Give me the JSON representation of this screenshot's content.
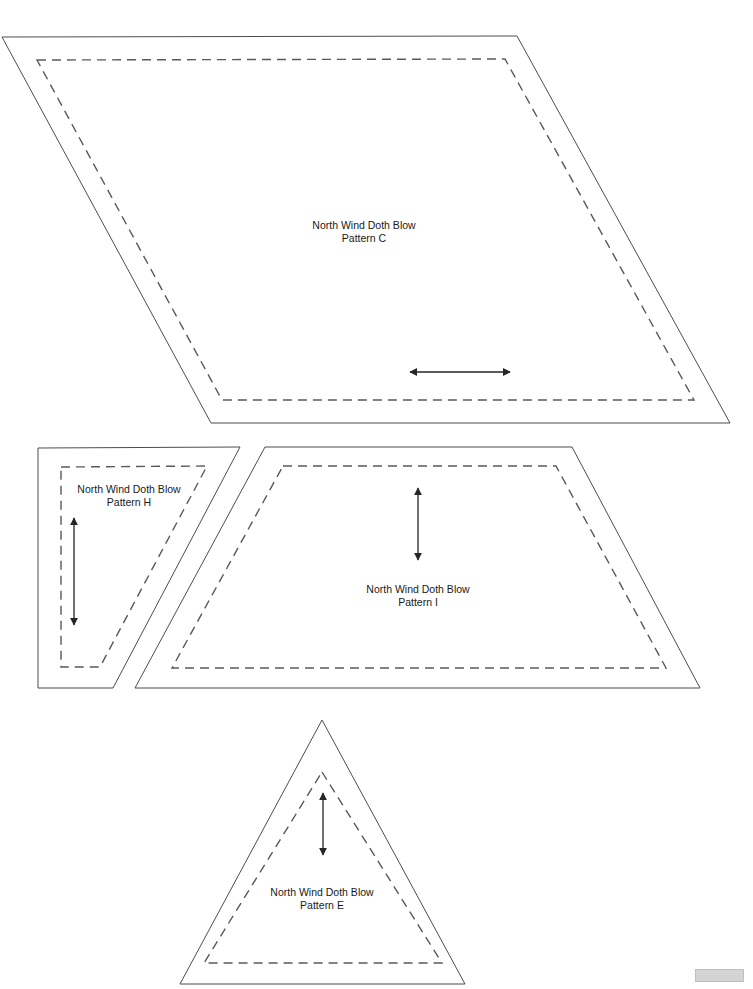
{
  "document": {
    "title": "North Wind Doth Blow",
    "kind": "quilt-pattern-template-sheet",
    "page_background": "#ffffff",
    "line_color": "#4d4d4d",
    "dash_color": "#595959",
    "arrow_color": "#262626"
  },
  "patterns": [
    {
      "id": "C",
      "name": "pattern-c",
      "label_line1": "North Wind Doth Blow",
      "label_line2": "Pattern C",
      "shape": "parallelogram",
      "cut_points": "2,37 517,36 730,423 211,423",
      "sew_points": "37,60 505,59 694,400 222,400",
      "label_x": 279,
      "label_y": 219,
      "label_width": 170,
      "grain_arrow": {
        "orientation": "horizontal",
        "x1": 410,
        "y1": 372,
        "x2": 510,
        "y2": 372
      }
    },
    {
      "id": "H",
      "name": "pattern-h",
      "label_line1": "North Wind Doth Blow",
      "label_line2": "Pattern H",
      "shape": "trapezoid",
      "cut_points": "38,448 240,447 113,688 38,688",
      "sew_points": "61,467 207,466 100,667 61,667",
      "label_x": 44,
      "label_y": 483,
      "label_width": 170,
      "grain_arrow": {
        "orientation": "vertical",
        "x1": 74,
        "y1": 518,
        "x2": 74,
        "y2": 625
      }
    },
    {
      "id": "I",
      "name": "pattern-i",
      "label_line1": "North Wind Doth Blow",
      "label_line2": "Pattern I",
      "shape": "trapezoid",
      "cut_points": "265,447 572,447 700,688 135,688",
      "sew_points": "283,466 556,466 666,668 172,668",
      "label_x": 333,
      "label_y": 583,
      "label_width": 170,
      "grain_arrow": {
        "orientation": "vertical",
        "x1": 418,
        "y1": 488,
        "x2": 418,
        "y2": 560
      }
    },
    {
      "id": "E",
      "name": "pattern-e",
      "label_line1": "North Wind Doth Blow",
      "label_line2": "Pattern E",
      "shape": "triangle",
      "cut_points": "322,720 465,984 180,984",
      "sew_points": "322,772 442,963 204,963",
      "label_x": 237,
      "label_y": 886,
      "label_width": 170,
      "grain_arrow": {
        "orientation": "vertical",
        "x1": 323,
        "y1": 793,
        "x2": 323,
        "y2": 855
      }
    }
  ],
  "page_marker": {
    "name": "page-corner-marker",
    "x": 695,
    "y": 969,
    "width": 47,
    "height": 11
  }
}
